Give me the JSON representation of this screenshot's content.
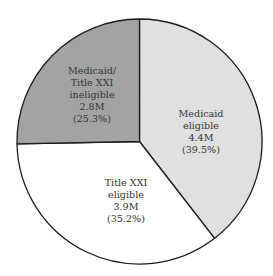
{
  "chart_data": {
    "type": "pie",
    "title": "",
    "start_angle_deg": 0,
    "direction": "clockwise",
    "slices": [
      {
        "name": "Medicaid eligible",
        "label_lines": [
          "Medicaid",
          "eligible",
          "4.4M",
          "(39.5%)"
        ],
        "value_millions": 4.4,
        "percent": 39.5,
        "color": "#e0e0e0"
      },
      {
        "name": "Title XXI eligible",
        "label_lines": [
          "Title XXI",
          "eligible",
          "3.9M",
          "(35.2%)"
        ],
        "value_millions": 3.9,
        "percent": 35.2,
        "color": "#ffffff"
      },
      {
        "name": "Medicaid/Title XXI ineligible",
        "label_lines": [
          "Medicaid/",
          "Title XXI",
          "ineligible",
          "2.8M",
          "(25.3%)"
        ],
        "value_millions": 2.8,
        "percent": 25.3,
        "color": "#a3a3a3"
      }
    ],
    "total_millions": 11.1,
    "legend": "none (labels inside slices)",
    "grid": false
  },
  "colors": {
    "outline": "#1a1a1a",
    "label_text": "#333333",
    "background": "#ffffff"
  }
}
